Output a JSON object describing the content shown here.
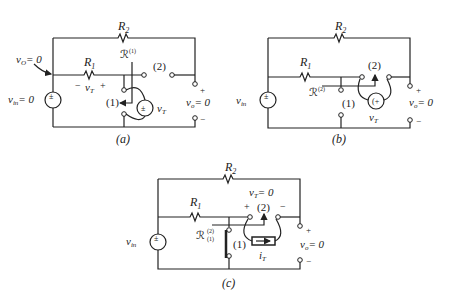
{
  "panels": {
    "a": {
      "caption": "(a)",
      "r2": "R",
      "r2_sub": "2",
      "r1": "R",
      "r1_sub": "1",
      "script_r": "ℛ",
      "script_r_sup": "(1)",
      "vo_arrow_label": "v",
      "vo_arrow_sub": "O",
      "vo_arrow_eq": "= 0",
      "vin_label": "v",
      "vin_sub": "in",
      "vin_eq": "= 0",
      "vt_minus": "−",
      "vt_label": "v",
      "vt_sub": "T",
      "vt_plus": "+",
      "node1": "(1)",
      "node2": "(2)",
      "src_vt": "v",
      "src_vt_sub": "T",
      "out_plus": "+",
      "out_minus": "−",
      "vo_label": "v",
      "vo_sub": "o",
      "vo_eq": "= 0"
    },
    "b": {
      "caption": "(b)",
      "r2": "R",
      "r2_sub": "2",
      "r1": "R",
      "r1_sub": "1",
      "script_r": "ℛ",
      "script_r_sup": "(2)",
      "vin_label": "v",
      "vin_sub": "in",
      "node1": "(1)",
      "node2": "(2)",
      "src_vt": "v",
      "src_vt_sub": "T",
      "out_plus": "+",
      "out_minus": "−",
      "vo_label": "v",
      "vo_sub": "o",
      "vo_eq": "= 0"
    },
    "c": {
      "caption": "(c)",
      "r2": "R",
      "r2_sub": "2",
      "r1": "R",
      "r1_sub": "1",
      "script_r": "ℛ",
      "script_r_sup": "(2)",
      "script_r_sub": "(1)",
      "vin_label": "v",
      "vin_sub": "in",
      "vt_label": "v",
      "vt_sub": "T",
      "vt_eq": "= 0",
      "vt_plus": "+",
      "vt_minus": "−",
      "node1": "(1)",
      "node2": "(2)",
      "it_label": "i",
      "it_sub": "T",
      "out_plus": "+",
      "out_minus": "−",
      "vo_label": "v",
      "vo_sub": "o",
      "vo_eq": "= 0"
    }
  }
}
